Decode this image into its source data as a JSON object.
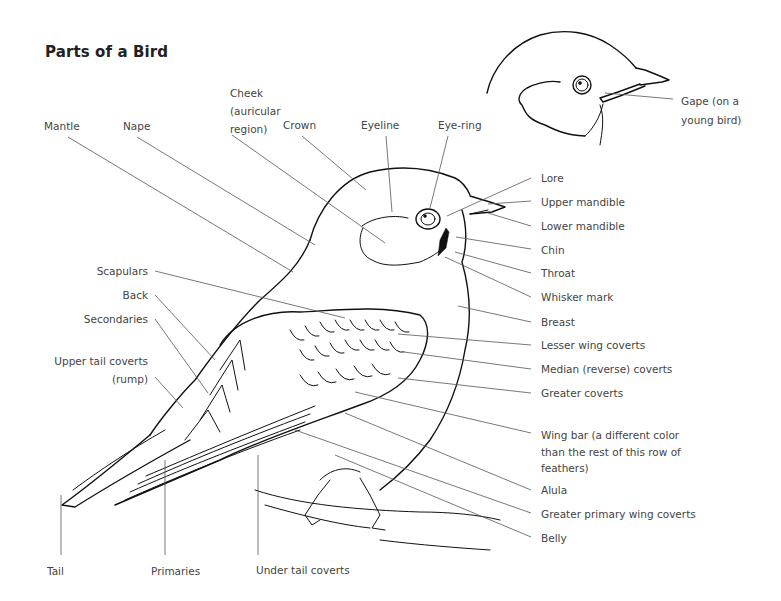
{
  "title": "Parts of a Bird",
  "labels": {
    "mantle": "Mantle",
    "nape": "Nape",
    "cheek": [
      "Cheek",
      "(auricular",
      "region)"
    ],
    "crown": "Crown",
    "eyeline": "Eyeline",
    "eye_ring": "Eye-ring",
    "gape": [
      "Gape (on a",
      "young bird)"
    ],
    "lore": "Lore",
    "upper_mandible": "Upper mandible",
    "lower_mandible": "Lower mandible",
    "chin": "Chin",
    "throat": "Throat",
    "whisker_mark": "Whisker mark",
    "breast": "Breast",
    "lesser_wing_coverts": "Lesser wing coverts",
    "median_coverts": "Median (reverse) coverts",
    "greater_coverts": "Greater coverts",
    "wing_bar": [
      "Wing bar (a different color",
      "than the rest of this row of",
      "feathers)"
    ],
    "alula": "Alula",
    "greater_primary_wing_coverts": "Greater primary wing coverts",
    "belly": "Belly",
    "scapulars": "Scapulars",
    "back": "Back",
    "secondaries": "Secondaries",
    "upper_tail_coverts": [
      "Upper tail coverts",
      "(rump)"
    ],
    "tail": "Tail",
    "primaries": "Primaries",
    "under_tail_coverts": "Under tail coverts"
  }
}
